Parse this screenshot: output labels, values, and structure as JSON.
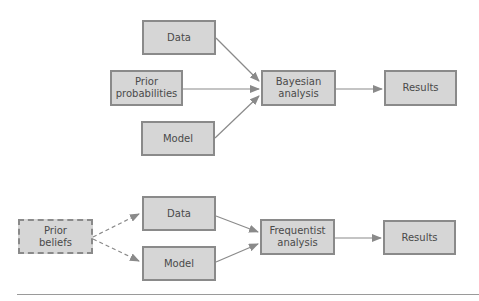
{
  "bayesian": {
    "data": "Data",
    "prior": "Prior probabilities",
    "model": "Model",
    "analysis": "Bayesian analysis",
    "results": "Results"
  },
  "frequentist": {
    "prior": "Prior beliefs",
    "data": "Data",
    "model": "Model",
    "analysis": "Frequentist analysis",
    "results": "Results"
  },
  "colors": {
    "box_fill": "#d6d6d6",
    "box_border": "#8a8a8a",
    "arrow": "#8a8a8a",
    "text": "#4a4a4a"
  }
}
